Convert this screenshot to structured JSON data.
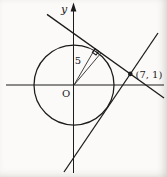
{
  "figure": {
    "labels": {
      "y_axis": "y",
      "origin": "O",
      "radius_length": "5",
      "external_point": "(7, 1)"
    },
    "geometry": {
      "circle_center": "O (origin)",
      "circle_radius": 5,
      "external_point": [
        7,
        1
      ],
      "tangent_line_count": 2,
      "right_angle_marked_at_tangency": true
    },
    "colors": {
      "ink": "#1c1c1c",
      "background": "#fbfaf8"
    }
  }
}
